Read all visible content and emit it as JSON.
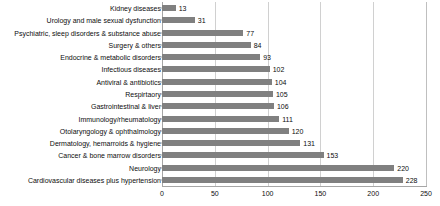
{
  "chart_data": {
    "type": "bar",
    "orientation": "horizontal",
    "title": "",
    "subtitle": "",
    "xlabel": "",
    "ylabel": "",
    "xlim": [
      0,
      250
    ],
    "xticks": [
      0,
      50,
      100,
      150,
      200,
      250
    ],
    "grid": "vertical",
    "legend": "none",
    "bar_color": "#808080",
    "gridline_color": "#d0d0d0",
    "axis_color": "#a6a6a6",
    "text_color": "#0d0d0d",
    "show_value_labels": true,
    "categories": [
      "Kidney diseases",
      "Urology and male sexual dysfunction",
      "Psychiatric, sleep disorders & substance abuse",
      "Surgery & others",
      "Endocrine & metabolic disorders",
      "Infectious diseases",
      "Antiviral & antibiotics",
      "Respirtaory",
      "Gastrointestinal & liver",
      "Immunology/rheumatology",
      "Otolaryngology & ophthalmology",
      "Dermatology, hemarroids & hygiene",
      "Cancer & bone marrow disorders",
      "Neurology",
      "Cardiovascular diseases plus hypertension"
    ],
    "values": [
      13,
      31,
      77,
      84,
      93,
      102,
      104,
      105,
      106,
      111,
      120,
      131,
      153,
      220,
      228
    ]
  }
}
